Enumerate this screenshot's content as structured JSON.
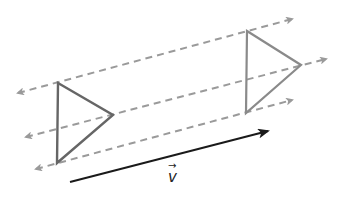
{
  "diagram": {
    "colors": {
      "guide_line": "#9a9a9a",
      "original_triangle": "#666666",
      "image_triangle": "#8a8a8a",
      "vector": "#1a1a1a"
    },
    "guide_lines": [
      {
        "x1": 18,
        "y1": 93,
        "x2": 292,
        "y2": 19
      },
      {
        "x1": 26,
        "y1": 137,
        "x2": 326,
        "y2": 59
      },
      {
        "x1": 36,
        "y1": 169,
        "x2": 292,
        "y2": 100
      }
    ],
    "original_triangle": {
      "points": "58,83 113,115 57,163"
    },
    "image_triangle": {
      "points": "247,31 301,65 246,113"
    },
    "vector": {
      "x1": 70,
      "y1": 182,
      "x2": 268,
      "y2": 131,
      "label": "v",
      "label_arrow": "→"
    }
  }
}
